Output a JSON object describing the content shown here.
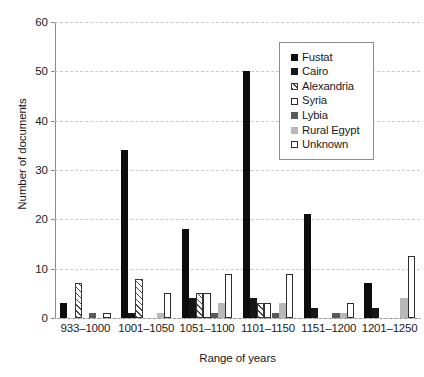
{
  "chart_data": {
    "type": "bar",
    "title": "",
    "xlabel": "Range of years",
    "ylabel": "Number of documents",
    "categories": [
      "933–1000",
      "1001–1050",
      "1051–1100",
      "1101–1150",
      "1151–1200",
      "1201–1250"
    ],
    "ylim": [
      0,
      60
    ],
    "yticks": [
      0,
      10,
      20,
      30,
      40,
      50,
      60
    ],
    "grid": true,
    "legend_position": "upper right",
    "series": [
      {
        "name": "Fustat",
        "color": "#0d0d0d",
        "fill": "solid-black",
        "values": [
          3,
          34,
          18,
          50,
          21,
          7
        ]
      },
      {
        "name": "Cairo",
        "color": "#161616",
        "fill": "solid-black",
        "values": [
          0,
          1,
          4,
          4,
          2,
          2
        ]
      },
      {
        "name": "Alexandria",
        "color": "#ffffff",
        "fill": "hatched",
        "values": [
          7,
          8,
          5,
          3,
          0,
          0
        ]
      },
      {
        "name": "Syria",
        "color": "#ffffff",
        "fill": "open-white",
        "values": [
          0,
          0,
          5,
          3,
          0,
          0
        ]
      },
      {
        "name": "Lybia",
        "color": "#5a5a5a",
        "fill": "solid-gray",
        "values": [
          1,
          0,
          1,
          1,
          1,
          0
        ]
      },
      {
        "name": "Rural Egypt",
        "color": "#b8b8b8",
        "fill": "solid-light",
        "values": [
          0,
          1,
          3,
          3,
          1,
          4
        ]
      },
      {
        "name": "Unknown",
        "color": "#ffffff",
        "fill": "open-white",
        "values": [
          1,
          5,
          9,
          9,
          3,
          12.5
        ]
      }
    ]
  },
  "axes": {
    "y_title": "Number of documents",
    "x_title": "Range of years"
  },
  "legend": {
    "entries": [
      {
        "label": "Fustat"
      },
      {
        "label": "Cairo"
      },
      {
        "label": "Alexandria"
      },
      {
        "label": "Syria"
      },
      {
        "label": "Lybia"
      },
      {
        "label": "Rural Egypt"
      },
      {
        "label": "Unknown"
      }
    ]
  }
}
